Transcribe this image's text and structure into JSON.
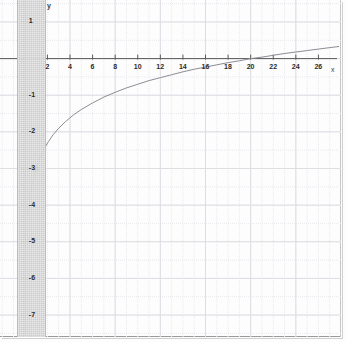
{
  "chart_data": {
    "type": "line",
    "title": "",
    "xlabel": "x",
    "ylabel": "y",
    "xlim": [
      -2.2,
      28
    ],
    "ylim": [
      -7.6,
      1.6
    ],
    "grid": true,
    "minor_grid": true,
    "legend": null,
    "function": "y = ln(x) - 3",
    "x_ticks": [
      2,
      4,
      6,
      8,
      10,
      12,
      14,
      16,
      18,
      20,
      22,
      24,
      26
    ],
    "x_tick_labels": [
      "2",
      "4",
      "6",
      "8",
      "10",
      "12",
      "14",
      "16",
      "18",
      "20",
      "22",
      "24",
      "26"
    ],
    "y_ticks": [
      1,
      -1,
      -2,
      -3,
      -4,
      -5,
      -6,
      -7
    ],
    "y_tick_labels": [
      "1",
      "-1",
      "-2",
      "-3",
      "-4",
      "-5",
      "-6",
      "-7"
    ],
    "marked_points": [
      {
        "x": 1,
        "y": -3,
        "label": ""
      }
    ],
    "series": [
      {
        "name": "y = ln(x) - 3",
        "color": "#8c8c94",
        "x": [
          0.28,
          0.32,
          0.36,
          0.42,
          0.48,
          0.55,
          0.63,
          0.72,
          0.82,
          0.92,
          1.0,
          1.2,
          1.45,
          1.75,
          2.1,
          2.5,
          3.0,
          3.6,
          4.3,
          5.0,
          6.0,
          7.0,
          8.0,
          9.0,
          10.0,
          11.0,
          12.0,
          13.0,
          14.0,
          15.0,
          16.0,
          17.0,
          18.0,
          19.0,
          20.0,
          21.0,
          22.0,
          23.0,
          24.0,
          25.0,
          26.0,
          27.0,
          27.8
        ],
        "y": [
          -4.27,
          -4.14,
          -4.02,
          -3.87,
          -3.73,
          -3.6,
          -3.46,
          -3.33,
          -3.2,
          -3.08,
          -3.0,
          -2.82,
          -2.63,
          -2.44,
          -2.26,
          -2.08,
          -1.9,
          -1.72,
          -1.54,
          -1.39,
          -1.21,
          -1.05,
          -0.92,
          -0.8,
          -0.7,
          -0.6,
          -0.52,
          -0.44,
          -0.36,
          -0.29,
          -0.23,
          -0.17,
          -0.11,
          -0.06,
          0.0,
          0.04,
          0.09,
          0.14,
          0.18,
          0.22,
          0.26,
          0.3,
          0.33
        ]
      }
    ],
    "axis_color": "#5a5a5a",
    "major_grid_color": "#dddde2",
    "minor_grid_color": "#e9e9ee",
    "shaded_band": {
      "from_x": -2.2,
      "to_x": 0,
      "color": "#c9c9c9"
    }
  }
}
